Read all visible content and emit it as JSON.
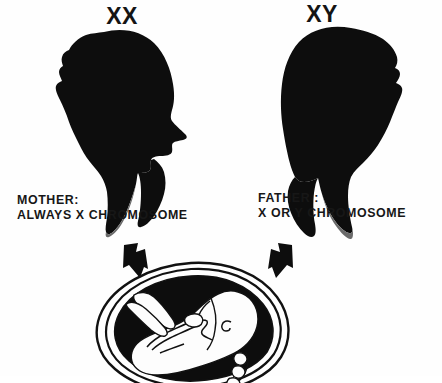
{
  "figure": {
    "background_color": "#fefefe",
    "ink_color": "#111111"
  },
  "parents": {
    "mother": {
      "karyotype": "XX",
      "caption_line1": "MOTHER:",
      "caption_line2": "ALWAYS X CHROMOSOME",
      "silhouette": "female-head-silhouette",
      "facing": "right"
    },
    "father": {
      "karyotype": "XY",
      "caption_line1": "FATHER :",
      "caption_line2": "X OR Y CHROMOSOME",
      "silhouette": "male-head-silhouette",
      "facing": "left"
    }
  },
  "arrows": {
    "left": {
      "icon": "arrow-down-right-icon",
      "direction": "down-right"
    },
    "right": {
      "icon": "arrow-down-left-icon",
      "direction": "down-left"
    }
  },
  "offspring": {
    "icon": "fetus-in-womb-icon",
    "description": "Fetus curled inside the womb with umbilical cord"
  }
}
